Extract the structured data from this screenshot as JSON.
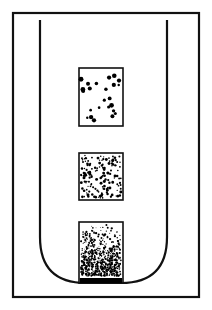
{
  "figure": {
    "domain": "Diagram",
    "kind": "line-art-schematic",
    "canvas": {
      "width": 212,
      "height": 310
    },
    "colors": {
      "background": "#ffffff",
      "stroke": "#111111",
      "dot": "#000000",
      "sediment": "#000000"
    }
  },
  "outer_frame": {
    "label": "outer-border-rectangle",
    "x": 13,
    "y": 13,
    "width": 186,
    "height": 284,
    "stroke_width": 2.2,
    "fill": "none"
  },
  "tube": {
    "label": "u-shaped-tube",
    "left": 40,
    "right": 167,
    "top": 21,
    "bottom": 283,
    "corner_radius": 46,
    "stroke_width": 2.2,
    "top_corners": "square",
    "bottom_corners": "rounded",
    "fill": "none"
  },
  "samples": [
    {
      "id": "sample-top",
      "label": "sparse-particle-band",
      "x": 79,
      "y": 68,
      "width": 44,
      "height": 58,
      "stroke_width": 1.6,
      "density": "sparse",
      "dot_count": 24,
      "dot_radius_min": 1.1,
      "dot_radius_max": 2.6,
      "seed": 11
    },
    {
      "id": "sample-middle",
      "label": "medium-particle-band",
      "x": 79,
      "y": 153,
      "width": 44,
      "height": 47,
      "stroke_width": 1.6,
      "density": "medium",
      "dot_count": 150,
      "dot_radius_min": 0.6,
      "dot_radius_max": 1.5,
      "seed": 29
    },
    {
      "id": "sample-bottom",
      "label": "dense-particle-band",
      "x": 79,
      "y": 222,
      "width": 44,
      "height": 61,
      "stroke_width": 1.6,
      "density": "dense",
      "dot_count": 620,
      "dot_radius_min": 0.4,
      "dot_radius_max": 1.2,
      "seed": 47,
      "sediment_band": {
        "label": "solid-sediment-layer",
        "height": 5,
        "fill": "#000000"
      }
    }
  ]
}
